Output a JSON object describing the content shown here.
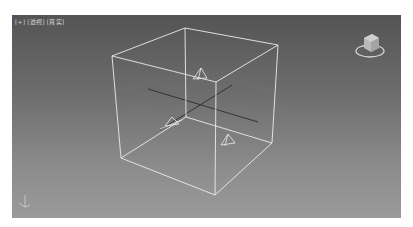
{
  "viewport": {
    "labels": {
      "plus": "[+]",
      "view": "[透视]",
      "shading": "[真实]"
    },
    "view_name": "Perspective",
    "shading_mode": "Realistic",
    "colors": {
      "background_top": "#545454",
      "background_bottom": "#9a9a9a",
      "wireframe": "#e8e8e8",
      "grid": "#7a7a7a",
      "grid_axis": "#2a2a2a"
    },
    "objects": [
      {
        "type": "box",
        "display": "wireframe"
      },
      {
        "type": "light-target",
        "count": 3
      }
    ],
    "viewcube": {
      "icon": "viewcube-icon"
    },
    "axis_tripod": {
      "icon": "axis-tripod-icon"
    }
  }
}
